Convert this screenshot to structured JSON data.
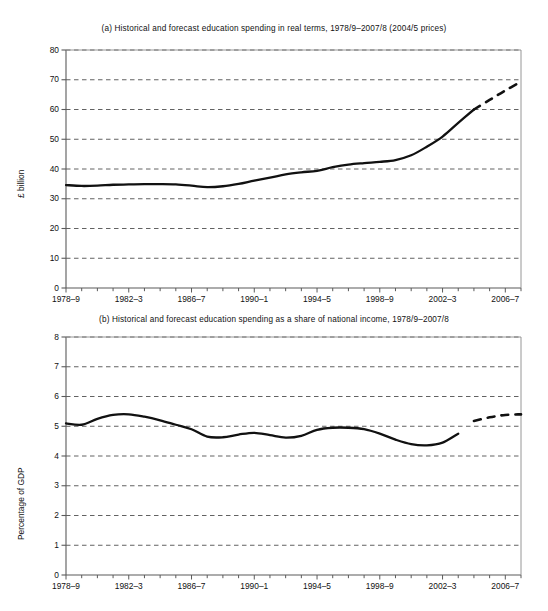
{
  "chart_data": [
    {
      "id": "a",
      "type": "line",
      "title": "(a) Historical and forecast education spending in real terms, 1978/9–2007/8 (2004/5 prices)",
      "xlabel": "",
      "ylabel": "£ billion",
      "ylim": [
        0,
        80
      ],
      "ytick_values": [
        0,
        10,
        20,
        30,
        40,
        50,
        60,
        70,
        80
      ],
      "ytick_labels": [
        "0",
        "10",
        "20",
        "30",
        "40",
        "50",
        "60",
        "70",
        "80"
      ],
      "xlim": [
        1978,
        2007
      ],
      "xtick_values": [
        1978,
        1982,
        1986,
        1990,
        1994,
        1998,
        2002,
        2006
      ],
      "xtick_labels": [
        "1978–9",
        "1982–3",
        "1986–7",
        "1990–1",
        "1994–5",
        "1998–9",
        "2002–3",
        "2006–7"
      ],
      "grid": "horizontal-dashed",
      "legend": "none",
      "x": [
        1978,
        1979,
        1980,
        1981,
        1982,
        1983,
        1984,
        1985,
        1986,
        1987,
        1988,
        1989,
        1990,
        1991,
        1992,
        1993,
        1994,
        1995,
        1996,
        1997,
        1998,
        1999,
        2000,
        2001,
        2002,
        2003,
        2004
      ],
      "series": [
        {
          "name": "Historical education spending (real terms)",
          "style": "solid",
          "values": [
            34.6,
            34.3,
            34.4,
            34.7,
            34.8,
            34.9,
            34.9,
            34.8,
            34.4,
            33.9,
            34.2,
            35.0,
            36.1,
            37.1,
            38.2,
            38.9,
            39.4,
            40.6,
            41.5,
            42.0,
            42.4,
            43.0,
            44.6,
            47.5,
            50.9,
            55.5,
            60.0
          ]
        },
        {
          "name": "Forecast education spending (real terms)",
          "style": "dashed",
          "x": [
            2004,
            2005,
            2006,
            2007
          ],
          "values": [
            60.0,
            63.2,
            66.4,
            69.3
          ]
        }
      ]
    },
    {
      "id": "b",
      "type": "line",
      "title": "(b) Historical and forecast education spending as a share of national income, 1978/9–2007/8",
      "xlabel": "",
      "ylabel": "Percentage of GDP",
      "ylim": [
        0,
        8
      ],
      "ytick_values": [
        0,
        1,
        2,
        3,
        4,
        5,
        6,
        7,
        8
      ],
      "ytick_labels": [
        "0",
        "1",
        "2",
        "3",
        "4",
        "5",
        "6",
        "7",
        "8"
      ],
      "xlim": [
        1978,
        2007
      ],
      "xtick_values": [
        1978,
        1982,
        1986,
        1990,
        1994,
        1998,
        2002,
        2006
      ],
      "xtick_labels": [
        "1978–9",
        "1982–3",
        "1986–7",
        "1990–1",
        "1994–5",
        "1998–9",
        "2002–3",
        "2006–7"
      ],
      "grid": "horizontal-dashed",
      "legend": "none",
      "x": [
        1978,
        1979,
        1980,
        1981,
        1982,
        1983,
        1984,
        1985,
        1986,
        1987,
        1988,
        1989,
        1990,
        1991,
        1992,
        1993,
        1994,
        1995,
        1996,
        1997,
        1998,
        1999,
        2000,
        2001,
        2002,
        2003,
        2004
      ],
      "series": [
        {
          "name": "Historical education spending (share of GDP)",
          "style": "solid",
          "values": [
            5.1,
            5.05,
            5.25,
            5.38,
            5.4,
            5.32,
            5.2,
            5.05,
            4.9,
            4.65,
            4.63,
            4.72,
            4.78,
            4.7,
            4.62,
            4.68,
            4.88,
            4.95,
            4.95,
            4.9,
            4.75,
            4.55,
            4.4,
            4.36,
            4.45,
            4.75,
            5.0,
            5.18
          ]
        },
        {
          "name": "Forecast education spending (share of GDP)",
          "style": "dashed",
          "x": [
            2004,
            2005,
            2006,
            2007
          ],
          "values": [
            5.18,
            5.3,
            5.38,
            5.4
          ]
        }
      ]
    }
  ],
  "figure_a": {
    "title": "(a) Historical and forecast education spending in real terms, 1978/9–2007/8 (2004/5 prices)",
    "y_axis_title": "£ billion"
  },
  "figure_b": {
    "title": "(b) Historical and forecast education spending as a share of national income, 1978/9–2007/8",
    "y_axis_title": "Percentage of GDP"
  },
  "bottom_caption": {
    "text": ""
  }
}
